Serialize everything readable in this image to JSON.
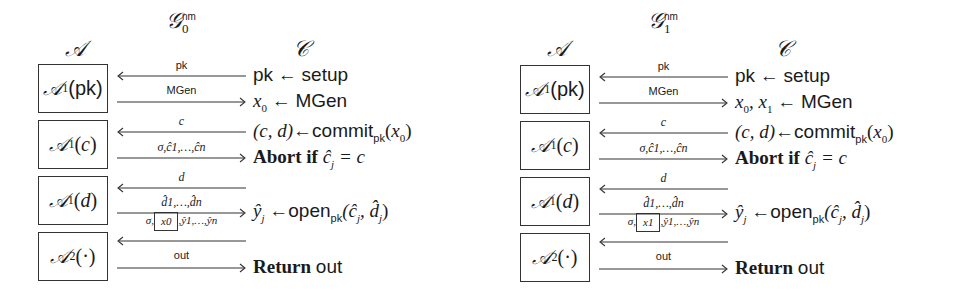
{
  "games": [
    {
      "title": {
        "symbol": "𝒢",
        "subscript": "0",
        "superscript": "nm"
      },
      "adversary_label": "𝒜",
      "challenger_label": "𝒞",
      "boxes": [
        {
          "symbol": "𝒜",
          "sub": "1",
          "arg": "pk",
          "arg_style": "sans"
        },
        {
          "symbol": "𝒜",
          "sub": "1",
          "arg": "c",
          "arg_style": "italic"
        },
        {
          "symbol": "𝒜",
          "sub": "1",
          "arg": "d",
          "arg_style": "italic"
        },
        {
          "symbol": "𝒜",
          "sub": "2",
          "arg": "·",
          "arg_style": "roman"
        }
      ],
      "messages": [
        {
          "label": "pk",
          "direction": "left"
        },
        {
          "label": "MGen",
          "direction": "right"
        },
        {
          "label": "c",
          "direction": "left"
        },
        {
          "label": "σ,ĉ1,…,ĉn",
          "direction": "right"
        },
        {
          "label": "d",
          "direction": "left"
        },
        {
          "label": "d̂1,…,d̂n",
          "direction": "right"
        },
        {
          "label_prefix": "σ,",
          "label_boxed": "x0",
          "label_suffix": ",ŷ1,…,ŷn",
          "direction": "left"
        },
        {
          "label": "out",
          "direction": "right"
        }
      ],
      "challenger_steps": [
        "pk ← setup",
        "x0 ← MGen",
        "(c, d) ← commitpk(x0)",
        "Abort if ĉj = c",
        "ŷj ← openpk(ĉj, d̂j)",
        "Return out"
      ],
      "step_parts": {
        "s1": {
          "lhs": "pk",
          "arrow": "←",
          "rhs": "setup"
        },
        "s2": {
          "lhs": "x",
          "lhs_sub": "0",
          "arrow": "←",
          "rhs": "MGen"
        },
        "s3": {
          "lhs": "(c, d)",
          "arrow": "←",
          "fn": "commit",
          "fn_sub": "pk",
          "arg_open": "(",
          "arg": "x",
          "arg_sub": "0",
          "arg_close": ")"
        },
        "s4": {
          "kw": "Abort if",
          "expr": "ĉ",
          "expr_sub": "j",
          "rest": " = c"
        },
        "s5": {
          "lhs": "ŷ",
          "lhs_sub": "j",
          "arrow": "←",
          "fn": "open",
          "fn_sub": "pk",
          "args": "(ĉ",
          "args_sub1": "j",
          "args_mid": ", d̂",
          "args_sub2": "j",
          "args_close": ")"
        },
        "s6": {
          "kw": "Return",
          "val": "out"
        }
      }
    },
    {
      "title": {
        "symbol": "𝒢",
        "subscript": "1",
        "superscript": "nm"
      },
      "adversary_label": "𝒜",
      "challenger_label": "𝒞",
      "boxes": [
        {
          "symbol": "𝒜",
          "sub": "1",
          "arg": "pk",
          "arg_style": "sans"
        },
        {
          "symbol": "𝒜",
          "sub": "1",
          "arg": "c",
          "arg_style": "italic"
        },
        {
          "symbol": "𝒜",
          "sub": "1",
          "arg": "d",
          "arg_style": "italic"
        },
        {
          "symbol": "𝒜",
          "sub": "2",
          "arg": "·",
          "arg_style": "roman"
        }
      ],
      "messages": [
        {
          "label": "pk",
          "direction": "left"
        },
        {
          "label": "MGen",
          "direction": "right"
        },
        {
          "label": "c",
          "direction": "left"
        },
        {
          "label": "σ,ĉ1,…,ĉn",
          "direction": "right"
        },
        {
          "label": "d",
          "direction": "left"
        },
        {
          "label": "d̂1,…,d̂n",
          "direction": "right"
        },
        {
          "label_prefix": "σ,",
          "label_boxed": "x1",
          "label_suffix": ",ŷ1,…,ŷn",
          "direction": "left"
        },
        {
          "label": "out",
          "direction": "right"
        }
      ],
      "challenger_steps": [
        "pk ← setup",
        "x0, x1 ← MGen",
        "(c, d) ← commitpk(x0)",
        "Abort if ĉj = c",
        "ŷj ← openpk(ĉj, d̂j)",
        "Return out"
      ],
      "step_parts": {
        "s1": {
          "lhs": "pk",
          "arrow": "←",
          "rhs": "setup"
        },
        "s2": {
          "lhs": "x0, x1"
        },
        "s3": {
          "lhs": "(c, d)",
          "arrow": "←",
          "fn": "commit",
          "fn_sub": "pk",
          "arg_open": "(",
          "arg": "x",
          "arg_sub": "0",
          "arg_close": ")"
        },
        "s4": {
          "kw": "Abort if",
          "expr": "ĉ",
          "expr_sub": "j",
          "rest": " = c"
        },
        "s5": {
          "lhs": "ŷ",
          "lhs_sub": "j",
          "arrow": "←",
          "fn": "open",
          "fn_sub": "pk",
          "args": "(ĉ",
          "args_sub1": "j",
          "args_mid": ", d̂",
          "args_sub2": "j",
          "args_close": ")"
        },
        "s6": {
          "kw": "Return",
          "val": "out"
        }
      }
    }
  ]
}
